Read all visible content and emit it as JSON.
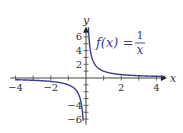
{
  "chart_data": {
    "type": "line",
    "title": "",
    "annotation": {
      "lhs": "f(x) =",
      "numerator": "1",
      "denominator": "x"
    },
    "xlabel": "x",
    "ylabel": "y",
    "xlim": [
      -4.3,
      4.6
    ],
    "ylim": [
      -6.8,
      7.5
    ],
    "x_ticks": [
      -4,
      -3,
      -2,
      -1,
      1,
      2,
      3,
      4
    ],
    "x_tick_labels": [
      {
        "value": -4,
        "label": "−4"
      },
      {
        "value": -2,
        "label": "−2"
      },
      {
        "value": 2,
        "label": "2"
      },
      {
        "value": 4,
        "label": "4"
      }
    ],
    "y_ticks": [
      -6,
      -5,
      -4,
      -3,
      -2,
      -1,
      1,
      2,
      3,
      4,
      5,
      6
    ],
    "y_tick_labels": [
      {
        "value": 6,
        "label": "6"
      },
      {
        "value": 4,
        "label": "4"
      },
      {
        "value": 2,
        "label": "2"
      },
      {
        "value": -4,
        "label": "−4"
      },
      {
        "value": -6,
        "label": "−6"
      }
    ],
    "grid": false,
    "series": [
      {
        "name": "f(x) = 1/x (x>0)",
        "function": "1/x",
        "domain": [
          0.135,
          4.5
        ],
        "color": "#3d3d8f"
      },
      {
        "name": "f(x) = 1/x (x<0)",
        "function": "1/x",
        "domain": [
          -4,
          -0.16
        ],
        "color": "#3d3d8f"
      }
    ]
  }
}
